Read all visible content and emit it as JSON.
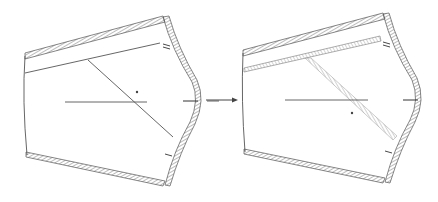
{
  "diagram": {
    "type": "before-after pattern transformation",
    "colors": {
      "background": "#ffffff",
      "line": "#555555",
      "hatch": "#888888",
      "light_hatch": "#aaaaaa"
    },
    "panels": [
      {
        "id": "before",
        "label": "",
        "outline": [
          [
            25,
            56
          ],
          [
            165,
            18
          ],
          [
            198,
            74
          ],
          [
            190,
            140
          ],
          [
            165,
            184
          ],
          [
            27,
            155
          ],
          [
            23,
            100
          ]
        ],
        "hatched_edges": [
          "top",
          "bottom",
          "right-curve"
        ],
        "inner_lines": [
          {
            "kind": "band",
            "from": [
              25,
              73
            ],
            "to": [
              160,
              43
            ]
          },
          {
            "kind": "diagonal",
            "from": [
              88,
              60
            ],
            "to": [
              173,
              137
            ]
          },
          {
            "kind": "center",
            "from": [
              65,
              102
            ],
            "to": [
              147,
              102
            ]
          },
          {
            "kind": "tick",
            "from": [
              183,
              101
            ],
            "to": [
              198,
              101
            ]
          }
        ],
        "marker": [
          137,
          92
        ]
      },
      {
        "id": "after",
        "label": "",
        "outline": [
          [
            243,
            52
          ],
          [
            385,
            15
          ],
          [
            418,
            72
          ],
          [
            410,
            138
          ],
          [
            385,
            180
          ],
          [
            245,
            152
          ],
          [
            243,
            100
          ]
        ],
        "hatched_edges": [
          "top",
          "bottom",
          "right-curve",
          "band",
          "diagonal"
        ],
        "inner_lines": [
          {
            "kind": "band",
            "from": [
              244,
              70
            ],
            "to": [
              380,
              38
            ]
          },
          {
            "kind": "diagonal",
            "from": [
              308,
              60
            ],
            "to": [
              395,
              138
            ]
          },
          {
            "kind": "center",
            "from": [
              285,
              100
            ],
            "to": [
              368,
              100
            ]
          },
          {
            "kind": "tick",
            "from": [
              403,
              100
            ],
            "to": [
              418,
              100
            ]
          }
        ],
        "marker": [
          352,
          113
        ]
      }
    ],
    "arrow": {
      "from": [
        206,
        100
      ],
      "to": [
        238,
        100
      ],
      "direction": "right"
    }
  }
}
